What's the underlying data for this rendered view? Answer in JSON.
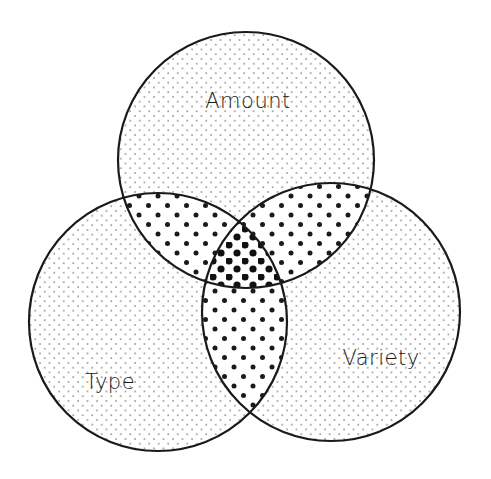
{
  "diagram": {
    "type": "venn",
    "sets": [
      {
        "id": "amount",
        "label": "Amount",
        "cx": 246,
        "cy": 160,
        "r": 128,
        "label_x": 248,
        "label_y": 108
      },
      {
        "id": "type",
        "label": "Type",
        "cx": 158,
        "cy": 322,
        "r": 129,
        "label_x": 110,
        "label_y": 389
      },
      {
        "id": "variety",
        "label": "Variety",
        "cx": 331,
        "cy": 312,
        "r": 129,
        "label_x": 381,
        "label_y": 365
      }
    ],
    "regions": {
      "single": {
        "pattern": "sparse-small-dots",
        "color": "#555555"
      },
      "pairwise": {
        "pattern": "medium-dots",
        "color": "#1a1a1a"
      },
      "triple": {
        "pattern": "large-dense-dots",
        "color": "#111111"
      }
    },
    "stroke_color": "#1a1a1a",
    "background": "#ffffff"
  }
}
